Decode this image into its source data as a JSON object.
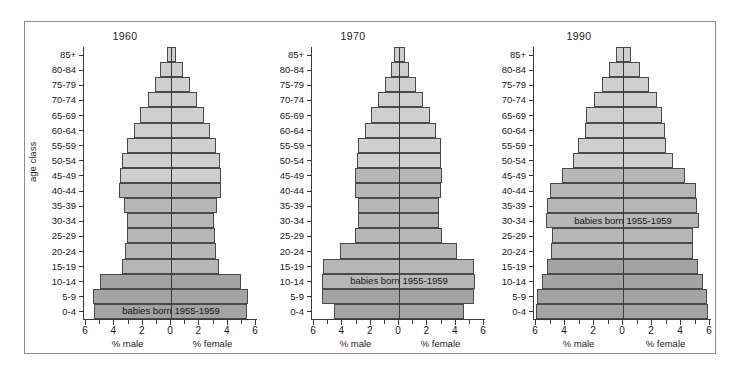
{
  "figure": {
    "yaxis_title": "age class",
    "colors": {
      "band_light": "#cfcfcf",
      "band_mid": "#b6b6b6",
      "band_dark": "#a3a3a3",
      "outline": "#4a4a4a",
      "axis": "#3a3a3a",
      "frame": "#8d8d8d",
      "background": "#ffffff"
    },
    "age_classes": [
      "85+",
      "80-84",
      "75-79",
      "70-74",
      "65-69",
      "60-64",
      "55-59",
      "50-54",
      "45-49",
      "40-44",
      "35-39",
      "30-34",
      "25-29",
      "20-24",
      "15-19",
      "10-14",
      "5-9",
      "0-4"
    ],
    "x_ticks": [
      "6",
      "4",
      "2",
      "0",
      "2",
      "4",
      "6"
    ],
    "x_caption_male": "% male",
    "x_caption_female": "% female",
    "annotation_text": "babies born 1955-1959"
  },
  "chart_data": [
    {
      "type": "bar",
      "title": "1960",
      "subtitle": "",
      "xlabel": "% male / % female",
      "ylabel": "age class",
      "xlim": [
        6,
        6
      ],
      "grid": false,
      "legend": "none",
      "categories": [
        "85+",
        "80-84",
        "75-79",
        "70-74",
        "65-69",
        "60-64",
        "55-59",
        "50-54",
        "45-49",
        "40-44",
        "35-39",
        "30-34",
        "25-29",
        "20-24",
        "15-19",
        "10-14",
        "5-9",
        "0-4"
      ],
      "series": [
        {
          "name": "% male",
          "values": [
            0.3,
            0.75,
            1.15,
            1.6,
            2.15,
            2.6,
            3.05,
            3.45,
            3.55,
            3.6,
            3.25,
            3.05,
            3.1,
            3.2,
            3.4,
            4.95,
            5.45,
            5.4
          ]
        },
        {
          "name": "% female",
          "values": [
            0.35,
            0.85,
            1.3,
            1.8,
            2.3,
            2.75,
            3.15,
            3.45,
            3.5,
            3.5,
            3.2,
            3.0,
            3.05,
            3.15,
            3.35,
            4.85,
            5.35,
            5.3
          ]
        }
      ],
      "band_breaks": {
        "light_to_mid_below": "40-44",
        "mid_to_dark_below": "10-14"
      },
      "annotation": {
        "text": "babies born 1955-1959",
        "at_category": "0-4"
      }
    },
    {
      "type": "bar",
      "title": "1970",
      "subtitle": "",
      "xlabel": "% male / % female",
      "ylabel": "age class",
      "xlim": [
        6,
        6
      ],
      "grid": false,
      "legend": "none",
      "categories": [
        "85+",
        "80-84",
        "75-79",
        "70-74",
        "65-69",
        "60-64",
        "55-59",
        "50-54",
        "45-49",
        "40-44",
        "35-39",
        "30-34",
        "25-29",
        "20-24",
        "15-19",
        "10-14",
        "5-9",
        "0-4"
      ],
      "series": [
        {
          "name": "% male",
          "values": [
            0.35,
            0.55,
            1.0,
            1.45,
            1.95,
            2.4,
            2.85,
            2.95,
            3.1,
            3.05,
            2.85,
            2.85,
            3.05,
            4.15,
            5.3,
            5.35,
            5.35,
            4.55
          ]
        },
        {
          "name": "% female",
          "values": [
            0.4,
            0.7,
            1.2,
            1.65,
            2.15,
            2.6,
            2.9,
            2.9,
            3.0,
            2.95,
            2.8,
            2.8,
            3.0,
            4.05,
            5.2,
            5.3,
            5.25,
            4.5
          ]
        }
      ],
      "band_breaks": {
        "light_to_mid_below": "45-49",
        "mid_to_dark_below": "5-9"
      },
      "annotation": {
        "text": "babies born 1955-1959",
        "at_category": "10-14"
      }
    },
    {
      "type": "bar",
      "title": "1990",
      "subtitle": "",
      "xlabel": "% male / % female",
      "ylabel": "age class",
      "xlim": [
        6,
        6
      ],
      "grid": false,
      "legend": "none",
      "categories": [
        "85+",
        "80-84",
        "75-79",
        "70-74",
        "65-69",
        "60-64",
        "55-59",
        "50-54",
        "45-49",
        "40-44",
        "35-39",
        "30-34",
        "25-29",
        "20-24",
        "15-19",
        "10-14",
        "5-9",
        "0-4"
      ],
      "series": [
        {
          "name": "% male",
          "values": [
            0.5,
            0.95,
            1.45,
            1.95,
            2.55,
            2.6,
            3.05,
            3.4,
            4.15,
            5.0,
            5.15,
            5.25,
            4.85,
            4.9,
            5.2,
            5.55,
            5.85,
            5.9
          ]
        },
        {
          "name": "% female",
          "values": [
            0.55,
            1.15,
            1.75,
            2.35,
            2.65,
            2.85,
            2.95,
            3.4,
            4.2,
            4.95,
            5.05,
            5.15,
            4.75,
            4.8,
            5.1,
            5.45,
            5.75,
            5.8
          ]
        }
      ],
      "band_breaks": {
        "light_to_mid_below": "45-49",
        "mid_to_dark_below": "15-19"
      },
      "annotation": {
        "text": "babies born 1955-1959",
        "at_category": "30-34"
      }
    }
  ]
}
